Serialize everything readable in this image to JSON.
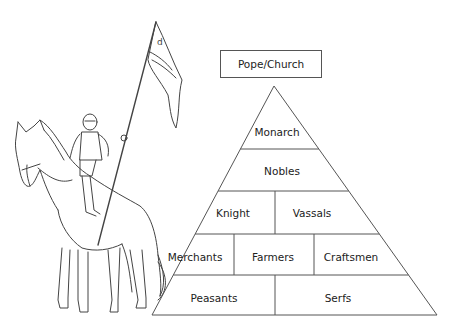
{
  "diagram": {
    "type": "feudal-hierarchy-pyramid",
    "top_box": "Pope/Church",
    "levels": [
      {
        "row": 1,
        "cells": [
          "Monarch"
        ]
      },
      {
        "row": 2,
        "cells": [
          "Nobles"
        ]
      },
      {
        "row": 3,
        "cells": [
          "Knight",
          "Vassals"
        ]
      },
      {
        "row": 4,
        "cells": [
          "Merchants",
          "Farmers",
          "Craftsmen"
        ]
      },
      {
        "row": 5,
        "cells": [
          "Peasants",
          "Serfs"
        ]
      }
    ],
    "illustration": "knight-on-horse-with-banner",
    "line_color": "#555555",
    "text_color": "#222222"
  }
}
